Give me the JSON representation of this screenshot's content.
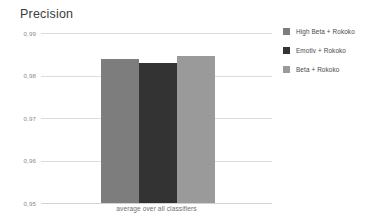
{
  "chart_data": {
    "type": "bar",
    "title": "Precision",
    "xlabel": "average over all classifiers",
    "ylabel": "",
    "categories": [
      "average over all classifiers"
    ],
    "series": [
      {
        "name": "High Beta + Rokoko",
        "values": [
          0.9838
        ],
        "color": "#7d7d7d"
      },
      {
        "name": "Emotiv + Rokoko",
        "values": [
          0.983
        ],
        "color": "#333333"
      },
      {
        "name": "Beta + Rokoko",
        "values": [
          0.9846
        ],
        "color": "#9a9a9a"
      }
    ],
    "ylim": [
      0.95,
      0.99
    ],
    "yticks": [
      0.99,
      0.98,
      0.97,
      0.96,
      0.95
    ],
    "ytick_labels": [
      "0,99",
      "0,98",
      "0,97",
      "0,96",
      "0,95"
    ],
    "grid": true,
    "legend_position": "right"
  },
  "legend": {
    "items": [
      {
        "label": "High Beta + Rokoko"
      },
      {
        "label": "Emotiv + Rokoko"
      },
      {
        "label": "Beta + Rokoko"
      }
    ]
  },
  "colors": {
    "background": "#ffffff",
    "grid": "#dcdcdc",
    "title_text": "#3c3c3c",
    "tick_text": "#8a8a8a",
    "axis_label_text": "#6e6e6e"
  }
}
